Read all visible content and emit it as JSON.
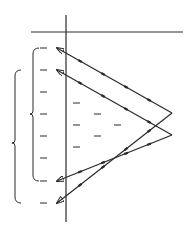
{
  "diagram": {
    "stroke_color": "#2a2a2a",
    "background": "#ffffff",
    "axes": {
      "vertical": {
        "x": 66,
        "y1": 15,
        "y2": 222
      },
      "horizontal": {
        "y": 32,
        "x1": 31,
        "x2": 183
      }
    },
    "paths": [
      {
        "name": "outer-path",
        "points": [
          [
            57,
            48
          ],
          [
            172,
            113
          ],
          [
            57,
            203
          ]
        ],
        "arrows": "both-ends"
      },
      {
        "name": "inner-path",
        "points": [
          [
            57,
            70
          ],
          [
            172,
            135
          ],
          [
            57,
            181
          ]
        ],
        "arrows": "both-ends"
      }
    ],
    "dashes_left_column": [
      48,
      70,
      92,
      114,
      136,
      158,
      181,
      203
    ],
    "dashes_interior": [
      {
        "x": 76,
        "y": 103
      },
      {
        "x": 76,
        "y": 125
      },
      {
        "x": 76,
        "y": 147
      },
      {
        "x": 97,
        "y": 114
      },
      {
        "x": 97,
        "y": 136
      },
      {
        "x": 117,
        "y": 125
      }
    ],
    "brackets": [
      {
        "name": "inner-bracket",
        "x": 33,
        "y1": 48,
        "y2": 181,
        "tip_y": 114
      },
      {
        "name": "outer-bracket",
        "x": 15,
        "y1": 70,
        "y2": 203,
        "tip_y": 143
      }
    ]
  }
}
